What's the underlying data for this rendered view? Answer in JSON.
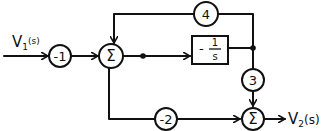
{
  "diagram": {
    "type": "block-diagram",
    "input": {
      "label": "V",
      "subscript": "1",
      "arg": "(s)"
    },
    "output": {
      "label": "V",
      "subscript": "2",
      "arg": "(s)"
    },
    "gains": [
      {
        "id": "g_input",
        "value": "-1"
      },
      {
        "id": "g_feedback",
        "value": "4"
      },
      {
        "id": "g_down",
        "value": "3"
      },
      {
        "id": "g_bottom",
        "value": "-2"
      }
    ],
    "integrator": {
      "numerator": "1",
      "denominator": "s",
      "sign": "-"
    },
    "summers": [
      {
        "id": "sum1",
        "symbol": "Σ"
      },
      {
        "id": "sum2",
        "symbol": "Σ"
      }
    ],
    "colors": {
      "stroke": "#111111",
      "background": "#ffffff"
    }
  }
}
